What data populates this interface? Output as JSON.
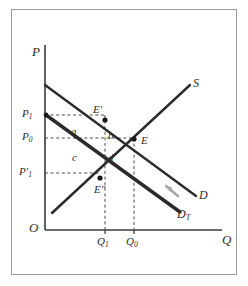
{
  "figure": {
    "kind": "supply-demand-tax-incidence-diagram",
    "background_color": "#ffffff",
    "frame_color": "#9a9a9a",
    "ink_color": "#2b2b2b"
  },
  "axes": {
    "vertical_label": "P",
    "horizontal_label": "Q",
    "origin_label": "O",
    "axis_color": "#3a3a3a"
  },
  "curves": [
    {
      "id": "supply",
      "label": "S",
      "style": "solid-thick",
      "color": "#2b2b2b",
      "description": "upward sloping supply curve"
    },
    {
      "id": "demand",
      "label": "D",
      "style": "solid-thick",
      "color": "#2b2b2b",
      "description": "original downward sloping demand curve"
    },
    {
      "id": "demand-after-tax",
      "label": "D",
      "label_sub": "T",
      "style": "solid-extra-thick",
      "color": "#2b2b2b",
      "description": "demand curve shifted down by the tax"
    }
  ],
  "price_ticks": [
    {
      "id": "p1",
      "label": "P",
      "sub": "1",
      "prime": false,
      "y": 115
    },
    {
      "id": "p0",
      "label": "P",
      "sub": "0",
      "prime": false,
      "y": 138
    },
    {
      "id": "p1-prime",
      "label": "P",
      "sub": "1",
      "prime": true,
      "y": 173
    }
  ],
  "quantity_ticks": [
    {
      "id": "q1",
      "label": "Q",
      "sub": "1",
      "x": 97
    },
    {
      "id": "q0",
      "label": "Q",
      "sub": "0",
      "x": 126
    }
  ],
  "points": [
    {
      "id": "e-prime",
      "label": "E",
      "prime": "single",
      "x": 105,
      "y": 120,
      "label_dx": -12,
      "label_dy": -16
    },
    {
      "id": "e",
      "label": "E",
      "prime": "none",
      "x": 134,
      "y": 139,
      "label_dx": 7,
      "label_dy": -4
    },
    {
      "id": "e-double-prime",
      "label": "E",
      "prime": "double",
      "x": 100,
      "y": 178,
      "label_dx": -6,
      "label_dy": 6
    }
  ],
  "regions": [
    {
      "id": "region-a",
      "label": "a",
      "x": 71,
      "y": 126
    },
    {
      "id": "region-b",
      "label": "b",
      "x": 108,
      "y": 130
    },
    {
      "id": "region-c",
      "label": "c",
      "x": 72,
      "y": 152
    },
    {
      "id": "region-d",
      "label": "d",
      "x": 108,
      "y": 152
    }
  ],
  "annotation": {
    "pointer_id": "tax-wedge-arrow",
    "description": "short grey arrow pointing from the demand curve toward the after-tax demand curve"
  }
}
